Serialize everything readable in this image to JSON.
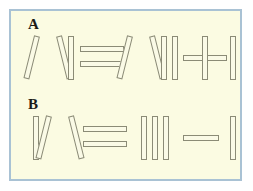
{
  "figure": {
    "name": "matchstick-roman-numeral-puzzle",
    "panel_background": "#fbfbe2",
    "panel_border_color": "#a9c2d4",
    "page_background": "#ffffff",
    "stick_fill": "#fafae6",
    "stick_outline": "#8b8b76",
    "label_color": "#1b1b17"
  },
  "rows": [
    {
      "label": "A",
      "equation_text": "VI = VII + I",
      "tokens": [
        {
          "glyph": "V",
          "kind": "roman-numeral",
          "sticks": 2
        },
        {
          "glyph": "I",
          "kind": "roman-numeral",
          "sticks": 1
        },
        {
          "glyph": "=",
          "kind": "operator",
          "sticks": 2
        },
        {
          "glyph": "V",
          "kind": "roman-numeral",
          "sticks": 2
        },
        {
          "glyph": "I",
          "kind": "roman-numeral",
          "sticks": 1
        },
        {
          "glyph": "I",
          "kind": "roman-numeral",
          "sticks": 1
        },
        {
          "glyph": "+",
          "kind": "operator",
          "sticks": 2
        },
        {
          "glyph": "I",
          "kind": "roman-numeral",
          "sticks": 1
        }
      ]
    },
    {
      "label": "B",
      "equation_text": "IV = III - I",
      "tokens": [
        {
          "glyph": "I",
          "kind": "roman-numeral",
          "sticks": 1
        },
        {
          "glyph": "V",
          "kind": "roman-numeral",
          "sticks": 2
        },
        {
          "glyph": "=",
          "kind": "operator",
          "sticks": 2
        },
        {
          "glyph": "I",
          "kind": "roman-numeral",
          "sticks": 1
        },
        {
          "glyph": "I",
          "kind": "roman-numeral",
          "sticks": 1
        },
        {
          "glyph": "I",
          "kind": "roman-numeral",
          "sticks": 1
        },
        {
          "glyph": "-",
          "kind": "operator",
          "sticks": 1
        },
        {
          "glyph": "I",
          "kind": "roman-numeral",
          "sticks": 1
        }
      ]
    }
  ]
}
